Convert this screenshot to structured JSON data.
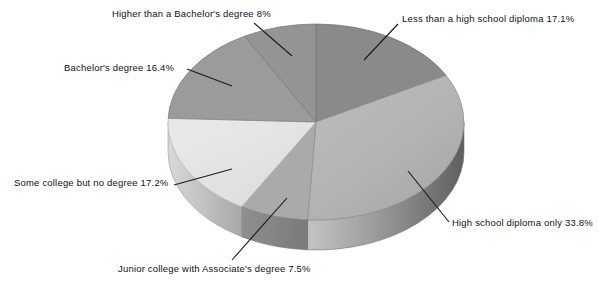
{
  "chart_data": {
    "type": "pie",
    "title": "",
    "subtitle": "",
    "xlabel": "",
    "ylabel": "",
    "legend_position": "none",
    "grid": false,
    "style": "3d-exploded-none",
    "units": "percent",
    "start_angle_deg": 0,
    "direction": "clockwise",
    "categories": [
      "Less than a high school diploma",
      "High school diploma only",
      "Junior college with Associate's degree",
      "Some college but no degree",
      "Bachelor's degree",
      "Higher than a Bachelor's degree"
    ],
    "values": [
      17.1,
      33.8,
      7.5,
      17.2,
      16.4,
      8
    ],
    "value_labels": [
      "17.1%",
      "33.8%",
      "7.5%",
      "17.2%",
      "16.4%",
      "8%"
    ],
    "colors": [
      "#8a8a8a",
      "#b3b3b3",
      "#aaaaaa",
      "#e3e3e3",
      "#9b9b9b",
      "#949494"
    ],
    "side_colors": [
      "#6e6e6e",
      "#8f8f8f",
      "#8a8a8a",
      "#bdbdbd",
      "#7c7c7c",
      "#777777"
    ],
    "slices": [
      {
        "label": "Less than a high school diploma",
        "value": 17.1,
        "value_label": "17.1%",
        "full_label": "Less than a high school diploma 17.1%",
        "color": "#8a8a8a"
      },
      {
        "label": "High school diploma only",
        "value": 33.8,
        "value_label": "33.8%",
        "full_label": "High school diploma only 33.8%",
        "color": "#b3b3b3"
      },
      {
        "label": "Junior college with Associate's degree",
        "value": 7.5,
        "value_label": "7.5%",
        "full_label": "Junior college with Associate's degree 7.5%",
        "color": "#aaaaaa"
      },
      {
        "label": "Some college but no degree",
        "value": 17.2,
        "value_label": "17.2%",
        "full_label": "Some college but no degree 17.2%",
        "color": "#e3e3e3"
      },
      {
        "label": "Bachelor's degree",
        "value": 16.4,
        "value_label": "16.4%",
        "full_label": "Bachelor's degree 16.4%",
        "color": "#9b9b9b"
      },
      {
        "label": "Higher than a Bachelor's degree",
        "value": 8,
        "value_label": "8%",
        "full_label": "Higher than a Bachelor's degree 8%",
        "color": "#949494"
      }
    ]
  }
}
